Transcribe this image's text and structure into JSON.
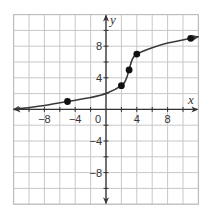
{
  "chart_data": {
    "type": "line",
    "title": "",
    "xlabel": "x",
    "ylabel": "y",
    "xlim": [
      -12,
      12
    ],
    "ylim": [
      -12,
      12
    ],
    "grid": true,
    "grid_step": 2,
    "x_tick_labels": [
      {
        "value": -8,
        "label": "−8"
      },
      {
        "value": -4,
        "label": "−4"
      },
      {
        "value": 0,
        "label": "0"
      },
      {
        "value": 4,
        "label": "4"
      },
      {
        "value": 8,
        "label": "8"
      }
    ],
    "y_tick_labels": [
      {
        "value": 8,
        "label": "8"
      },
      {
        "value": 4,
        "label": "4"
      },
      {
        "value": -4,
        "label": "−4"
      },
      {
        "value": -8,
        "label": "−8"
      }
    ],
    "series": [
      {
        "name": "curve",
        "points": [
          [
            -5,
            1
          ],
          [
            2,
            3
          ],
          [
            3,
            5
          ],
          [
            4,
            7
          ],
          [
            11,
            9
          ]
        ],
        "curve_path": [
          [
            -12,
            0
          ],
          [
            -8,
            0.5
          ],
          [
            -5,
            1
          ],
          [
            -2,
            1.5
          ],
          [
            0,
            2
          ],
          [
            2,
            3
          ],
          [
            2.6,
            3.8
          ],
          [
            3,
            5
          ],
          [
            3.4,
            6.3
          ],
          [
            4,
            7
          ],
          [
            6,
            7.8
          ],
          [
            8,
            8.4
          ],
          [
            11,
            9
          ],
          [
            12,
            9.2
          ]
        ],
        "arrows_both_ends": true,
        "color": "#3a3a3a"
      }
    ],
    "legend": null
  },
  "colors": {
    "grid": "#c8c8c8",
    "axis": "#333333",
    "curve": "#3a3a3a",
    "point": "#111111",
    "border": "#bbbbbb"
  }
}
